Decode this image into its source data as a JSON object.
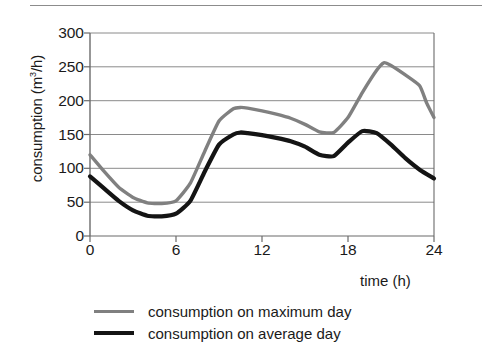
{
  "chart_data": {
    "type": "line",
    "title": "",
    "xlabel": "time (h)",
    "ylabel": "consumption (m³/h)",
    "ylabel_prefix": "consumption (m",
    "ylabel_sup": "3",
    "ylabel_suffix": "/h)",
    "xlim": [
      0,
      24
    ],
    "ylim": [
      0,
      300
    ],
    "xticks": [
      0,
      6,
      12,
      18,
      24
    ],
    "xtick_labels": [
      "0",
      "6",
      "12",
      "18",
      "24"
    ],
    "yticks": [
      0,
      50,
      100,
      150,
      200,
      250,
      300
    ],
    "ytick_labels": [
      "0",
      "50",
      "100",
      "150",
      "200",
      "250",
      "300"
    ],
    "grid": "horizontal",
    "legend_position": "below",
    "series": [
      {
        "name": "consumption on maximum day",
        "color": "#808080",
        "x": [
          0,
          1,
          2,
          3,
          4,
          5,
          6,
          7,
          8,
          9,
          10,
          10.5,
          11,
          12,
          13,
          14,
          15,
          16,
          17,
          18,
          19,
          20,
          20.5,
          21,
          22,
          23,
          23.5,
          24
        ],
        "values": [
          120,
          95,
          72,
          57,
          49,
          48,
          52,
          78,
          125,
          170,
          188,
          190,
          189,
          185,
          180,
          174,
          165,
          154,
          153,
          175,
          212,
          245,
          256,
          252,
          238,
          222,
          196,
          175
        ]
      },
      {
        "name": "consumption on average day",
        "color": "#141414",
        "x": [
          0,
          1,
          2,
          3,
          4,
          5,
          6,
          7,
          8,
          9,
          10,
          10.5,
          11,
          12,
          13,
          14,
          15,
          16,
          17,
          18,
          19,
          20,
          21,
          22,
          23,
          24
        ],
        "values": [
          88,
          70,
          52,
          38,
          30,
          29,
          33,
          52,
          95,
          135,
          150,
          153,
          152,
          149,
          145,
          140,
          132,
          120,
          118,
          138,
          155,
          152,
          135,
          115,
          98,
          85
        ]
      }
    ]
  },
  "legend": {
    "items": [
      {
        "label": "consumption on maximum day",
        "style": "max"
      },
      {
        "label": "consumption on average day",
        "style": "avg"
      }
    ]
  },
  "colors": {
    "maximum_day": "#808080",
    "average_day": "#141414",
    "grid": "#808080",
    "axis": "#6b6b6b",
    "text": "#1a1a1a",
    "background": "#ffffff"
  }
}
